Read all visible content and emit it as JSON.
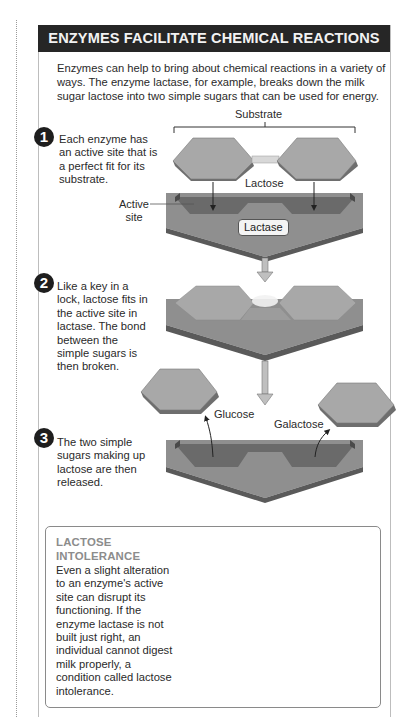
{
  "header": {
    "title": "ENZYMES FACILITATE CHEMICAL REACTIONS"
  },
  "intro": "Enzymes can help to bring about chemical reactions in a variety of ways. The enzyme lactase, for example, breaks down the milk sugar lactose into two simple sugars that can be used for energy.",
  "steps": [
    {
      "number": "1",
      "text": "Each enzyme has an active site that is a perfect fit for its substrate."
    },
    {
      "number": "2",
      "text": "Like a key in a lock, lactose fits in the active site in lactase. The bond between the simple sugars is then broken."
    },
    {
      "number": "3",
      "text": "The two simple sugars making up lactose are then released."
    }
  ],
  "labels": {
    "substrate": "Substrate",
    "lactose": "Lactose",
    "active_site_line1": "Active",
    "active_site_line2": "site",
    "lactase": "Lactase",
    "glucose": "Glucose",
    "galactose": "Galactose"
  },
  "callout": {
    "title_line1": "LACTOSE",
    "title_line2": "INTOLERANCE",
    "body": "Even a slight alteration to an enzyme's active site can disrupt its functioning. If the enzyme lactase is not built just right, an individual cannot digest milk properly, a condition called lactose intolerance."
  },
  "icons": {
    "blocked": "prohibition-icon",
    "arrow_down": "down-arrow-icon"
  },
  "colors": {
    "header_bg": "#262626",
    "header_text": "#f2f2f2",
    "sugar_top": "#a8a8a8",
    "sugar_side": "#6e6e6e",
    "enzyme_top": "#8f8f8f",
    "enzyme_pocket": "#6a6a6a",
    "enzyme_side": "#5a5a5a",
    "bond": "#d8d8d8",
    "callout_title": "#8c8c8c"
  }
}
